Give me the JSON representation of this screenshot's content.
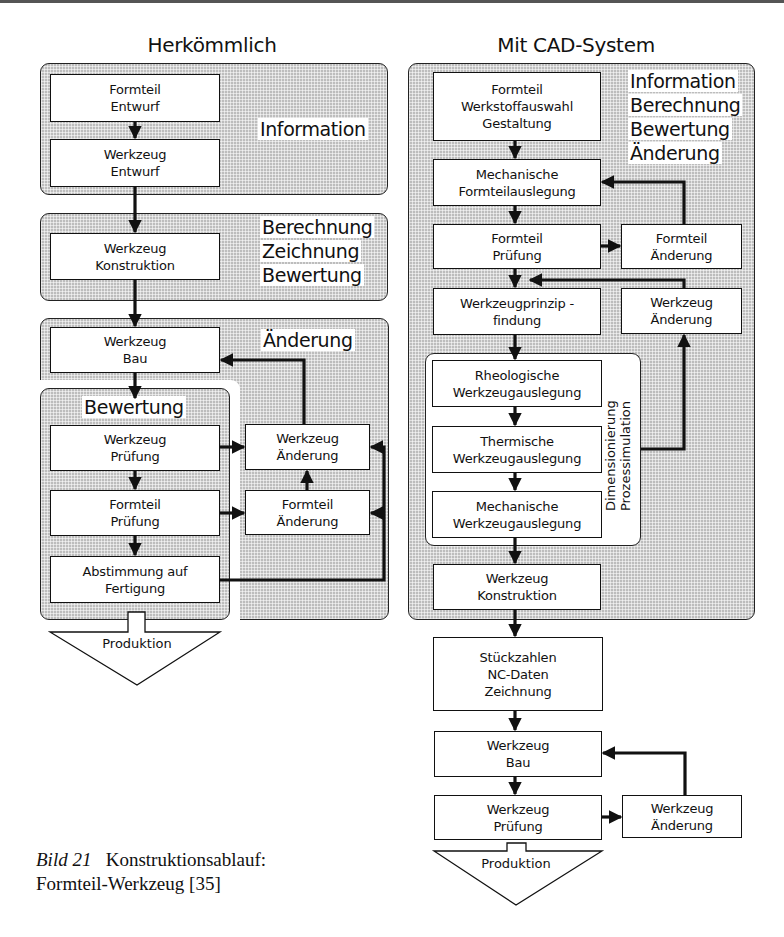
{
  "figure": {
    "caption_label": "Bild 21",
    "caption_title": "Konstruktionsablauf:",
    "caption_line2": "Formteil-Werkzeug [35]"
  },
  "left": {
    "title": "Herkömmlich",
    "panels": {
      "information": {
        "label": "Information"
      },
      "konstruktion": {
        "labels": [
          "Berechnung",
          "Zeichnung",
          "Bewertung"
        ]
      },
      "aenderung": {
        "label": "Änderung"
      },
      "bewertung": {
        "label": "Bewertung"
      }
    },
    "boxes": {
      "formteil_entwurf": [
        "Formteil",
        "Entwurf"
      ],
      "werkzeug_entwurf": [
        "Werkzeug",
        "Entwurf"
      ],
      "werkzeug_konstruktion": [
        "Werkzeug",
        "Konstruktion"
      ],
      "werkzeug_bau": [
        "Werkzeug",
        "Bau"
      ],
      "werkzeug_pruefung": [
        "Werkzeug",
        "Prüfung"
      ],
      "formteil_pruefung": [
        "Formteil",
        "Prüfung"
      ],
      "abstimmung": [
        "Abstimmung auf",
        "Fertigung"
      ],
      "werkzeug_aenderung": [
        "Werkzeug",
        "Änderung"
      ],
      "formteil_aenderung": [
        "Formteil",
        "Änderung"
      ]
    },
    "produktion": "Produktion"
  },
  "right": {
    "title": "Mit CAD-System",
    "panel_labels": [
      "Information",
      "Berechnung",
      "Bewertung",
      "Änderung"
    ],
    "subgroup_labels": [
      "Dimensionierung",
      "Prozessimulation"
    ],
    "boxes": {
      "formteil_gestaltung": [
        "Formteil",
        "Werkstoffauswahl",
        "Gestaltung"
      ],
      "mech_formteilauslegung": [
        "Mechanische",
        "Formteilauslegung"
      ],
      "formteil_pruefung": [
        "Formteil",
        "Prüfung"
      ],
      "formteil_aenderung": [
        "Formteil",
        "Änderung"
      ],
      "werkzeugprinzip": [
        "Werkzeugprinzip -",
        "findung"
      ],
      "werkzeug_aenderung_top": [
        "Werkzeug",
        "Änderung"
      ],
      "rheologische": [
        "Rheologische",
        "Werkzeugauslegung"
      ],
      "thermische": [
        "Thermische",
        "Werkzeugauslegung"
      ],
      "mechanische_wz": [
        "Mechanische",
        "Werkzeugauslegung"
      ],
      "werkzeug_konstruktion": [
        "Werkzeug",
        "Konstruktion"
      ],
      "stueckzahlen": [
        "Stückzahlen",
        "NC-Daten",
        "Zeichnung"
      ],
      "werkzeug_bau": [
        "Werkzeug",
        "Bau"
      ],
      "werkzeug_pruefung": [
        "Werkzeug",
        "Prüfung"
      ],
      "werkzeug_aenderung_bottom": [
        "Werkzeug",
        "Änderung"
      ]
    },
    "produktion": "Produktion"
  }
}
